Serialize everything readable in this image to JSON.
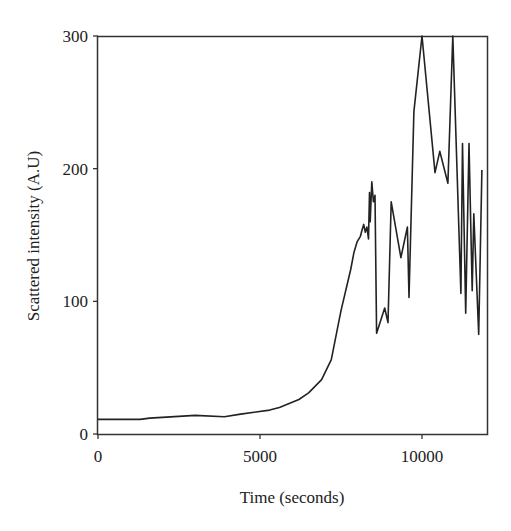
{
  "chart_data": {
    "type": "line",
    "title": "",
    "xlabel": "Time (seconds)",
    "ylabel": "Scattered intensity (A.U)",
    "xlim": [
      0,
      12000
    ],
    "ylim": [
      0,
      300
    ],
    "xticks": [
      0,
      5000,
      10000
    ],
    "yticks": [
      0,
      100,
      200,
      300
    ],
    "xtick_labels": [
      "0",
      "5000",
      "10000"
    ],
    "ytick_labels": [
      "0",
      "100",
      "200",
      "300"
    ],
    "grid": false,
    "legend": null,
    "series": [
      {
        "name": "Scattered intensity",
        "color": "#222222",
        "x": [
          0,
          1300,
          1600,
          3000,
          3900,
          4400,
          5300,
          5600,
          6200,
          6500,
          6900,
          7200,
          7500,
          7800,
          7900,
          8000,
          8100,
          8150,
          8200,
          8250,
          8300,
          8350,
          8380,
          8400,
          8450,
          8500,
          8550,
          8600,
          8850,
          8950,
          9050,
          9350,
          9550,
          9600,
          9750,
          10000,
          10400,
          10550,
          10800,
          10950,
          11200,
          11250,
          11350,
          11450,
          11550,
          11600,
          11750,
          11850
        ],
        "y": [
          11,
          11,
          12,
          14,
          13,
          15,
          18,
          20,
          26,
          31,
          41,
          56,
          93,
          124,
          137,
          145,
          149,
          154,
          158,
          152,
          156,
          147,
          182,
          160,
          190,
          175,
          180,
          76,
          95,
          84,
          175,
          133,
          156,
          103,
          243,
          300,
          197,
          213,
          189,
          300,
          106,
          219,
          91,
          219,
          108,
          166,
          75,
          199
        ]
      }
    ]
  },
  "axes": {
    "x_title": "Time (seconds)",
    "y_title": "Scattered intensity (A.U)",
    "x_tick_labels": [
      "0",
      "5000",
      "10000"
    ],
    "y_tick_labels": [
      "0",
      "100",
      "200",
      "300"
    ]
  }
}
